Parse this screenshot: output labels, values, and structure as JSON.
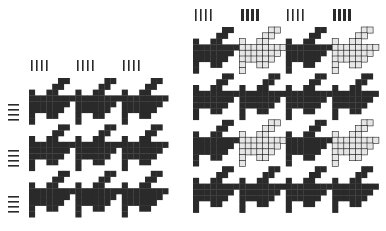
{
  "figure": {
    "colors": {
      "dark": "#2a2a2a",
      "light": "#e6e6e6",
      "background": "#ffffff",
      "outline": "#1e1e1e"
    },
    "left_pattern": {
      "name": "Solid houndstooth",
      "tiles_x": 3,
      "tiles_y": 3,
      "top_marker_groups": [
        {
          "type": "thin",
          "count": 4
        },
        {
          "type": "thin",
          "count": 4
        },
        {
          "type": "thin",
          "count": 4
        }
      ],
      "side_marker_groups": [
        {
          "type": "thin",
          "count": 4
        },
        {
          "type": "thin",
          "count": 4
        },
        {
          "type": "thin",
          "count": 4
        }
      ]
    },
    "right_pattern": {
      "name": "Two-color houndstooth variant",
      "tiles_x": 4,
      "tiles_y": 4,
      "top_marker_groups": [
        {
          "type": "thin",
          "count": 4
        },
        {
          "type": "thick",
          "count": 4
        },
        {
          "type": "thin",
          "count": 4
        },
        {
          "type": "thick",
          "count": 4
        }
      ],
      "side_marker_groups": [
        {
          "type": "thick",
          "count": 4
        },
        {
          "type": "thin",
          "count": 4
        },
        {
          "type": "thick",
          "count": 4
        },
        {
          "type": "thin",
          "count": 4
        }
      ]
    }
  }
}
